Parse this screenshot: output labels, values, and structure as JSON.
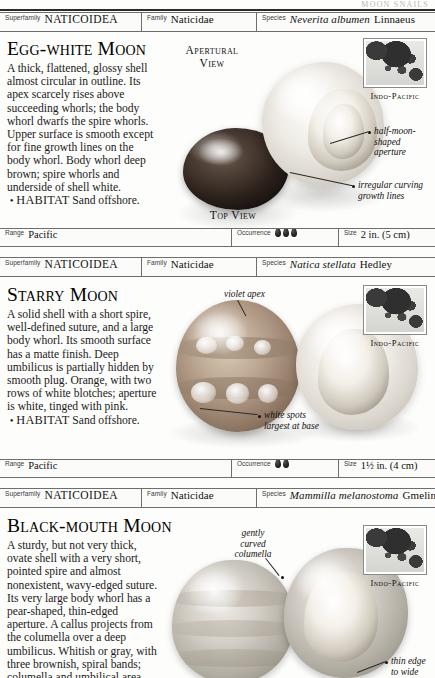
{
  "page": {
    "running_head": "MOON SNAILS",
    "folio": "71"
  },
  "labels": {
    "superfamily": "Superfamily",
    "family": "Family",
    "species": "Species",
    "range": "Range",
    "occurrence": "Occurrence",
    "size": "Size"
  },
  "entries": [
    {
      "superfamily": "NATICOIDEA",
      "family": "Naticidae",
      "species_italic": "Neverita albumen",
      "species_author": "Linnaeus",
      "title": "Egg-white Moon",
      "description_html": "A thick, flattened, glossy shell almost circular in outline. Its apex scarcely rises above succeeding whorls; the body whorl dwarfs the spire whorls. Upper surface is smooth except for fine growth lines on the body whorl. Body whorl deep brown; spire whorls and underside of shell white.",
      "habitat_label": "HABITAT",
      "habitat_text": "Sand offshore.",
      "view_caption_1": "Apertural\nView",
      "view_caption_2": "Top View",
      "callouts": [
        "half-moon-\nshaped\naperture",
        "irregular curving\ngrowth lines"
      ],
      "map_caption": "Indo-Pacific",
      "range": "Pacific",
      "occurrence_count": 3,
      "size": "2 in. (5 cm)"
    },
    {
      "superfamily": "NATICOIDEA",
      "family": "Naticidae",
      "species_italic": "Natica stellata",
      "species_author": "Hedley",
      "title": "Starry Moon",
      "description_html": "A solid shell with a short spire, well-defined suture, and a large body whorl. Its smooth surface has a matte finish. Deep umbilicus is partially hidden by smooth plug. Orange, with two rows of white blotches; aperture is white, tinged with pink.",
      "habitat_label": "HABITAT",
      "habitat_text": "Sand offshore.",
      "callouts": [
        "violet apex",
        "white spots\nlargest at base"
      ],
      "map_caption": "Indo-Pacific",
      "range": "Pacific",
      "occurrence_count": 2,
      "size": "1½ in. (4 cm)",
      "size_prefix": "1",
      "size_fraction": "1/2",
      "size_suffix": "in. (4 cm)"
    },
    {
      "superfamily": "NATICOIDEA",
      "family": "Naticidae",
      "species_italic": "Mammilla melanostoma",
      "species_author": "Gmelin",
      "title": "Black-mouth Moon",
      "description_html": "A sturdy, but not very thick, ovate shell with a very short, pointed spire and almost nonexistent, wavy-edged suture. Its very large body whorl has a pear-shaped, thin-edged aperture. A callus projects from the columella over a deep umbilicus. Whitish or gray, with three brownish, spiral bands; columella and umbilical area darker brown.",
      "callouts": [
        "gently\ncurved\ncolumella",
        "thin edge\nto wide"
      ],
      "map_caption": "Indo-Pacific"
    }
  ]
}
